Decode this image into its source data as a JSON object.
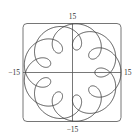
{
  "chart_data": {
    "type": "line",
    "subtype": "parametric",
    "title": "",
    "xlabel": "",
    "ylabel": "",
    "xlim": [
      -15,
      15
    ],
    "ylim": [
      -15,
      15
    ],
    "grid": false,
    "legend": null,
    "equation": {
      "x": "11 cos t - 4 cos(11t/2)",
      "y": "11 sin t - 4 sin(11t/2)",
      "a": 11,
      "b": 4,
      "k": 5.5,
      "t_range": [
        0,
        12.566370614359172
      ]
    },
    "tick_labels": {
      "top": "15",
      "bottom": "−15",
      "left": "−15",
      "right": "15"
    },
    "series": [
      {
        "name": "curve",
        "color": "#444444"
      }
    ]
  },
  "style": {
    "axis_color": "#555555",
    "frame_color": "#666666",
    "curve_color": "#444444"
  }
}
